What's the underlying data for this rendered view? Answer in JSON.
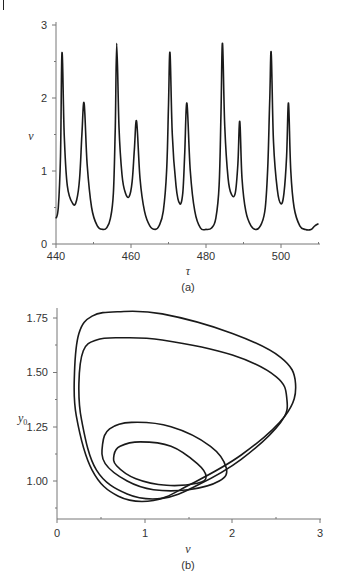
{
  "page": {
    "header_text": "",
    "caption_text": ""
  },
  "chart_data": [
    {
      "type": "line",
      "panel_label": "(a)",
      "title": "",
      "xlabel": "τ",
      "ylabel": "v",
      "xlim": [
        440,
        510
      ],
      "ylim": [
        0,
        3
      ],
      "xticks": [
        "440",
        "460",
        "480",
        "500"
      ],
      "yticks": [
        "0",
        "1",
        "2",
        "3"
      ],
      "grid": false,
      "legend": null,
      "series": [
        {
          "name": "v(τ)",
          "x": [
            440,
            440.6,
            441.2,
            441.6,
            442.2,
            443,
            444.5,
            445.5,
            446.3,
            446.9,
            447.5,
            448.3,
            449.5,
            451,
            452.5,
            453.5,
            454.5,
            455.3,
            455.8,
            456.2,
            456.8,
            457.6,
            458.5,
            459.5,
            460.3,
            460.9,
            461.5,
            462.4,
            463.6,
            465,
            466.5,
            467.5,
            468.6,
            469.5,
            470,
            470.4,
            471,
            472,
            473,
            473.8,
            474.3,
            474.9,
            475.8,
            477,
            478.5,
            480,
            481.5,
            482.6,
            483.5,
            484,
            484.4,
            485,
            485.9,
            486.8,
            487.8,
            488.5,
            489,
            489.6,
            490.6,
            492,
            493.5,
            494.8,
            495.8,
            496.5,
            497,
            497.4,
            498,
            499,
            500,
            500.8,
            501.5,
            502,
            502.6,
            503.5,
            505,
            506.5,
            508,
            509,
            510
          ],
          "values": [
            0.35,
            0.5,
            1.2,
            2.62,
            1.5,
            0.8,
            0.55,
            0.6,
            0.9,
            1.5,
            1.93,
            1.1,
            0.5,
            0.25,
            0.2,
            0.22,
            0.35,
            0.7,
            1.6,
            2.75,
            1.6,
            0.95,
            0.7,
            0.65,
            0.85,
            1.3,
            1.68,
            0.9,
            0.45,
            0.25,
            0.2,
            0.25,
            0.45,
            1.0,
            1.9,
            2.62,
            1.5,
            0.8,
            0.55,
            0.7,
            1.2,
            1.93,
            1.0,
            0.45,
            0.22,
            0.2,
            0.22,
            0.35,
            0.8,
            1.8,
            2.75,
            1.6,
            0.9,
            0.68,
            0.7,
            1.1,
            1.68,
            0.9,
            0.45,
            0.25,
            0.2,
            0.28,
            0.5,
            1.1,
            2.0,
            2.62,
            1.4,
            0.75,
            0.55,
            0.7,
            1.2,
            1.93,
            1.0,
            0.5,
            0.25,
            0.2,
            0.2,
            0.25,
            0.28
          ]
        }
      ],
      "peaks": [
        {
          "tau": 441.5,
          "v": 2.62
        },
        {
          "tau": 447.3,
          "v": 1.93
        },
        {
          "tau": 456.2,
          "v": 2.75
        },
        {
          "tau": 461.3,
          "v": 1.68
        },
        {
          "tau": 470.4,
          "v": 2.62
        },
        {
          "tau": 474.6,
          "v": 1.93
        },
        {
          "tau": 484.4,
          "v": 2.75
        },
        {
          "tau": 489.0,
          "v": 1.68
        },
        {
          "tau": 497.4,
          "v": 2.62
        },
        {
          "tau": 502.2,
          "v": 1.93
        }
      ]
    },
    {
      "type": "line",
      "panel_label": "(b)",
      "title": "",
      "xlabel": "v",
      "ylabel": "y0",
      "xlim": [
        0,
        3
      ],
      "ylim": [
        0.825,
        1.8
      ],
      "xticks": [
        "0",
        "1",
        "2",
        "3"
      ],
      "yticks": [
        "1.00",
        "1.25",
        "1.50",
        "1.75"
      ],
      "grid": false,
      "legend": null,
      "description": "Phase portrait (limit cycle) of y0 versus v: four nested closed loops",
      "series": [
        {
          "name": "outer loop",
          "x": [
            0.7,
            1.2,
            2.0,
            2.55,
            2.72,
            2.6,
            2.1,
            1.5,
            1.1,
            0.7,
            0.4,
            0.22,
            0.2,
            0.25,
            0.4,
            0.7
          ],
          "values": [
            1.78,
            1.77,
            1.68,
            1.57,
            1.45,
            1.3,
            1.12,
            0.98,
            0.91,
            0.93,
            1.05,
            1.3,
            1.5,
            1.68,
            1.76,
            1.78
          ]
        },
        {
          "name": "second loop",
          "x": [
            0.7,
            1.2,
            2.0,
            2.5,
            2.62,
            2.55,
            2.1,
            1.6,
            1.2,
            0.8,
            0.45,
            0.28,
            0.25,
            0.3,
            0.45,
            0.7
          ],
          "values": [
            1.66,
            1.65,
            1.58,
            1.48,
            1.38,
            1.27,
            1.1,
            0.98,
            0.92,
            0.94,
            1.05,
            1.28,
            1.45,
            1.6,
            1.65,
            1.66
          ]
        },
        {
          "name": "third loop",
          "x": [
            0.85,
            1.3,
            1.75,
            1.93,
            1.85,
            1.5,
            1.1,
            0.8,
            0.55,
            0.52,
            0.6,
            0.85
          ],
          "values": [
            1.27,
            1.25,
            1.16,
            1.06,
            1.0,
            0.96,
            0.96,
            1.0,
            1.08,
            1.17,
            1.24,
            1.27
          ]
        },
        {
          "name": "inner loop",
          "x": [
            0.95,
            1.3,
            1.6,
            1.7,
            1.6,
            1.25,
            0.9,
            0.68,
            0.65,
            0.72,
            0.95
          ],
          "values": [
            1.18,
            1.16,
            1.08,
            1.02,
            0.99,
            0.98,
            1.01,
            1.07,
            1.12,
            1.16,
            1.18
          ]
        }
      ]
    }
  ],
  "charts": {
    "a": {
      "panel_label": "(a)",
      "xlabel": "τ",
      "ylabel": "v",
      "xtick_labels": [
        "440",
        "460",
        "480",
        "500"
      ],
      "ytick_labels": [
        "0",
        "1",
        "2",
        "3"
      ]
    },
    "b": {
      "panel_label": "(b)",
      "xlabel": "v",
      "ylabel": "y",
      "ylabel_sub": "0",
      "xtick_labels": [
        "0",
        "1",
        "2",
        "3"
      ],
      "ytick_labels": [
        "1.00",
        "1.25",
        "1.50",
        "1.75"
      ]
    }
  }
}
